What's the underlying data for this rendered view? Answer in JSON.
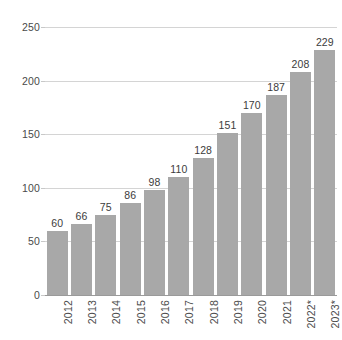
{
  "chart_data": {
    "type": "bar",
    "title": "",
    "subtitle": "",
    "xlabel": "",
    "ylabel": "",
    "categories": [
      "2012",
      "2013",
      "2014",
      "2015",
      "2016",
      "2017",
      "2018",
      "2019",
      "2020",
      "2021",
      "2022*",
      "2023*"
    ],
    "values": [
      60,
      66,
      75,
      86,
      98,
      110,
      128,
      151,
      170,
      187,
      208,
      229
    ],
    "data_labels": [
      "60",
      "66",
      "75",
      "86",
      "98",
      "110",
      "128",
      "151",
      "170",
      "187",
      "208",
      "229"
    ],
    "ylim": [
      0,
      250
    ],
    "ytick_values": [
      0,
      50,
      100,
      150,
      200,
      250
    ],
    "ytick_labels": [
      "0",
      "50",
      "100",
      "150",
      "200",
      "250"
    ],
    "grid": true,
    "grid_axis": "y",
    "legend": "none",
    "bar_color": "#a8a8a8",
    "gridline_color": "#d4d4d4",
    "axis_color": "#9a9a9a",
    "label_color": "#4a4a4a",
    "background_color": "#ffffff",
    "annotations": []
  }
}
